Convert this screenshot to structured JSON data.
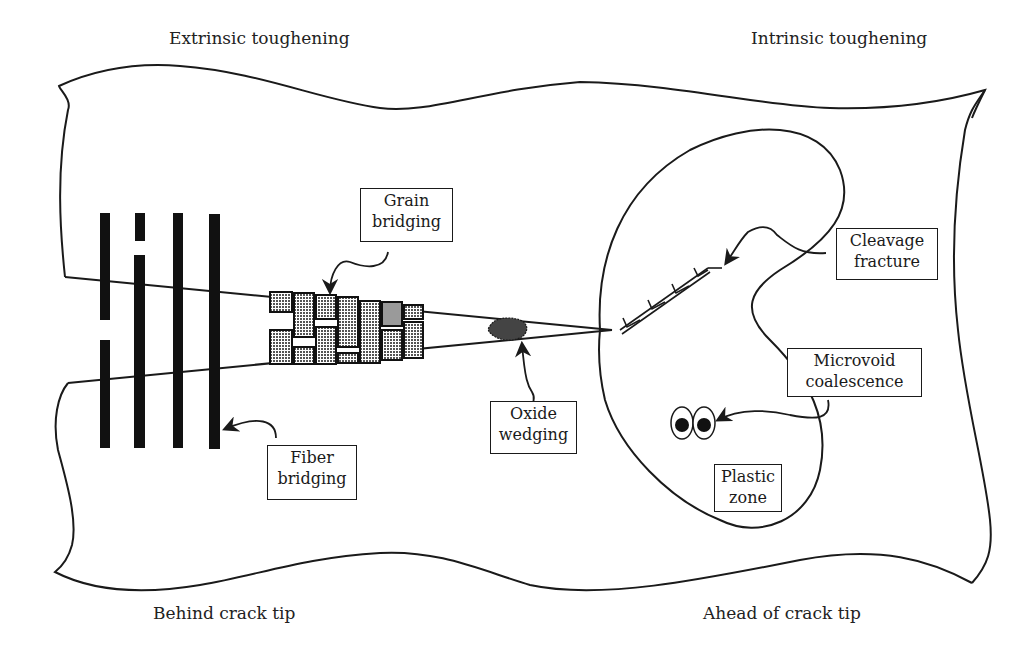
{
  "headings": {
    "top_left": "Extrinsic toughening",
    "top_right": "Intrinsic toughening",
    "bottom_left": "Behind crack tip",
    "bottom_right": "Ahead of crack tip"
  },
  "labels": {
    "grain_bridging": {
      "line1": "Grain",
      "line2": "bridging"
    },
    "fiber_bridging": {
      "line1": "Fiber",
      "line2": "bridging"
    },
    "oxide_wedging": {
      "line1": "Oxide",
      "line2": "wedging"
    },
    "cleavage_fracture": {
      "line1": "Cleavage",
      "line2": "fracture"
    },
    "microvoid_coalescence": {
      "line1": "Microvoid",
      "line2": "coalescence"
    },
    "plastic_zone": {
      "line1": "Plastic",
      "line2": "zone"
    }
  },
  "colors": {
    "ink": "#1a1a1a",
    "grain_fill": "#8a8a8a",
    "background": "#ffffff"
  }
}
